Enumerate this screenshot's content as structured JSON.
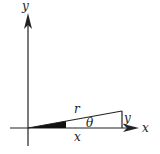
{
  "diagram": {
    "type": "polar-coordinates-triangle",
    "labels": {
      "y_axis": "y",
      "x_axis": "x",
      "hypotenuse": "r",
      "angle": "θ",
      "adjacent": "x",
      "opposite": "y"
    },
    "colors": {
      "stroke": "#222222",
      "fill_wedge": "#111111",
      "background": "#ffffff"
    }
  }
}
